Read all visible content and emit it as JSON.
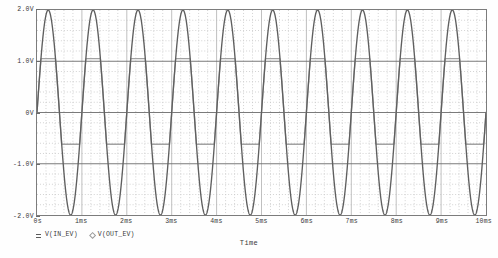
{
  "window": {
    "title": "Transient Analysis"
  },
  "axes": {
    "x_title": "Time",
    "y_ticks": [
      "2.0V",
      "1.0V",
      "0V",
      "-1.0V",
      "-2.0V"
    ],
    "x_ticks": [
      "0s",
      "1ms",
      "2ms",
      "3ms",
      "4ms",
      "5ms",
      "6ms",
      "7ms",
      "8ms",
      "9ms",
      "10ms"
    ]
  },
  "legend": {
    "entries": [
      {
        "label": "V(IN_EV)",
        "marker": "sq",
        "color": "#5a5a5a"
      },
      {
        "label": "V(OUT_EV)",
        "marker": "dia",
        "color": "#9a9a9a"
      }
    ]
  },
  "colors": {
    "frame": "#7c7c7c",
    "grid_major": "#b8b8b8",
    "grid_minor": "#c8c8c8",
    "axis_line": "#6b6b6b",
    "trace_in": "#5f5f5f",
    "trace_out": "#a2a2a2",
    "background": "#ffffff"
  },
  "chart_data": {
    "type": "line",
    "title": "",
    "xlabel": "Time",
    "ylabel": "",
    "xlim": [
      0,
      0.01
    ],
    "ylim": [
      -2.0,
      2.0
    ],
    "x_unit": "s",
    "y_unit": "V",
    "grid": true,
    "legend_position": "bottom-left",
    "x_tick_values": [
      0,
      0.001,
      0.002,
      0.003,
      0.004,
      0.005,
      0.006,
      0.007,
      0.008,
      0.009,
      0.01
    ],
    "x_tick_labels": [
      "0s",
      "1ms",
      "2ms",
      "3ms",
      "4ms",
      "5ms",
      "6ms",
      "7ms",
      "8ms",
      "9ms",
      "10ms"
    ],
    "y_tick_values": [
      2.0,
      1.0,
      0.0,
      -1.0,
      -2.0
    ],
    "y_tick_labels": [
      "2.0V",
      "1.0V",
      "0V",
      "-1.0V",
      "-2.0V"
    ],
    "series": [
      {
        "name": "V(IN_EV)",
        "color": "#5f5f5f",
        "waveform": "sine",
        "amplitude": 2.0,
        "offset": 0.0,
        "frequency_hz": 1000,
        "phase_deg": 0,
        "cycles": 10,
        "clip_high": null,
        "clip_low": null
      },
      {
        "name": "V(OUT_EV)",
        "color": "#a2a2a2",
        "waveform": "clipped-sine",
        "amplitude": 2.0,
        "offset": 0.0,
        "frequency_hz": 1000,
        "phase_deg": 0,
        "cycles": 10,
        "clip_high": 1.05,
        "clip_low": -0.62
      }
    ]
  }
}
